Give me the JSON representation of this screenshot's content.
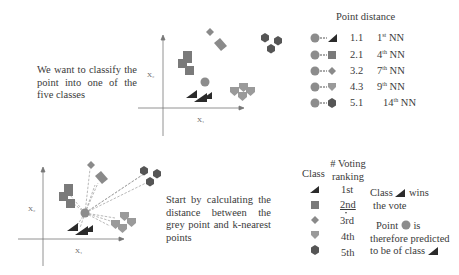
{
  "top_panel": {
    "description": "We want to classify the point into one of the five classes",
    "x_axis_label": "X₁",
    "y_axis_label": "X₂"
  },
  "point_distance": {
    "title": "Point distance",
    "rows": [
      {
        "shape": "black-wedge",
        "distance": "1.1",
        "nn_num": "1",
        "nn_sup": "st",
        "nn_suffix": "NN"
      },
      {
        "shape": "square",
        "distance": "2.1",
        "nn_num": "4",
        "nn_sup": "th",
        "nn_suffix": "NN"
      },
      {
        "shape": "diamond",
        "distance": "3.2",
        "nn_num": "7",
        "nn_sup": "th",
        "nn_suffix": "NN"
      },
      {
        "shape": "shield",
        "distance": "4.3",
        "nn_num": "9",
        "nn_sup": "th",
        "nn_suffix": "NN"
      },
      {
        "shape": "hexagon",
        "distance": "5.1",
        "nn_num": "14",
        "nn_sup": "th",
        "nn_suffix": "NN"
      }
    ]
  },
  "bottom_panel": {
    "description": "Start by calculating the distance between the grey point and k-nearest points",
    "x_axis_label": "X₁",
    "y_axis_label": "X₂"
  },
  "voting": {
    "class_header": "Class",
    "ranking_header_line1": "# Voting",
    "ranking_header_line2": "ranking",
    "rows": [
      {
        "shape": "black-wedge",
        "rank": "1st"
      },
      {
        "shape": "square",
        "rank": "2nd"
      },
      {
        "shape": "diamond",
        "rank": "3rd"
      },
      {
        "shape": "shield",
        "rank": "4th"
      },
      {
        "shape": "hexagon",
        "rank": "5th"
      }
    ]
  },
  "result": {
    "line1_a": "Class",
    "line1_b": "wins",
    "line2": "the vote",
    "line3_a": "Point",
    "line3_b": "is",
    "line4": "therefore predicted",
    "line5": "to be of class"
  },
  "colors": {
    "black_wedge": "#2b2b2b",
    "square": "#7a7a7a",
    "diamond": "#8a8a8a",
    "shield": "#9a9a9a",
    "hexagon": "#555555",
    "grey_point": "#8c8c8c",
    "axis": "#777777"
  }
}
